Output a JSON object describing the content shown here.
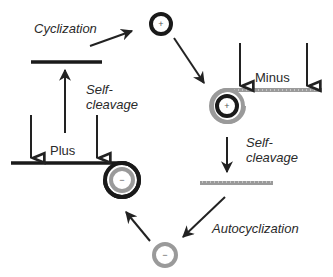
{
  "diagram": {
    "type": "replication-cycle",
    "colors": {
      "plus_strand": "#1a1a1a",
      "minus_strand": "#9a9a9a",
      "arrow": "#222222",
      "text": "#2a2a2a"
    },
    "labels": {
      "cyclization": "Cyclization",
      "self_cleavage_left_1": "Self-",
      "self_cleavage_left_2": "cleavage",
      "plus": "Plus",
      "minus": "Minus",
      "self_cleavage_right_1": "Self-",
      "self_cleavage_right_2": "cleavage",
      "autocyclization": "Autocyclization"
    },
    "symbols": {
      "plus_circle_top": "+",
      "plus_circle_coil": "+",
      "minus_circle_coil": "−",
      "minus_circle_bottom": "−"
    },
    "nodes": [
      {
        "id": "plus-monomer-linear",
        "strand": "plus",
        "shape": "line"
      },
      {
        "id": "plus-circle",
        "strand": "plus",
        "shape": "circle",
        "sign": "+"
      },
      {
        "id": "minus-multimer-on-plus-circle",
        "strand": "minus",
        "shape": "rolling-circle"
      },
      {
        "id": "minus-monomer-linear",
        "strand": "minus",
        "shape": "line"
      },
      {
        "id": "minus-circle",
        "strand": "minus",
        "shape": "circle",
        "sign": "-"
      },
      {
        "id": "plus-multimer-on-minus-circle",
        "strand": "plus",
        "shape": "rolling-circle"
      }
    ],
    "edges": [
      {
        "from": "plus-monomer-linear",
        "to": "plus-circle",
        "label": "Cyclization"
      },
      {
        "from": "plus-circle",
        "to": "minus-multimer-on-plus-circle",
        "label": ""
      },
      {
        "from": "minus-multimer-on-plus-circle",
        "to": "minus-monomer-linear",
        "label": "Self-cleavage"
      },
      {
        "from": "minus-monomer-linear",
        "to": "minus-circle",
        "label": "Autocyclization"
      },
      {
        "from": "minus-circle",
        "to": "plus-multimer-on-minus-circle",
        "label": ""
      },
      {
        "from": "plus-multimer-on-minus-circle",
        "to": "plus-monomer-linear",
        "label": "Self-cleavage"
      }
    ]
  }
}
